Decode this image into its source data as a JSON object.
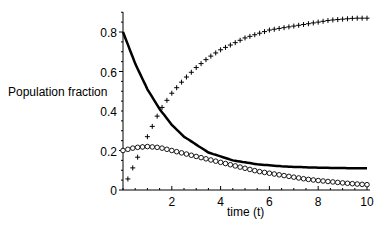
{
  "chart_data": {
    "type": "line",
    "title": "",
    "xlabel": "time (t)",
    "ylabel": "Population fraction",
    "xlim": [
      0,
      10
    ],
    "ylim": [
      0,
      0.9
    ],
    "x_ticks": [
      "2",
      "4",
      "6",
      "8",
      "10"
    ],
    "y_ticks": [
      "0",
      "0.2",
      "0.4",
      "0.6",
      "0.8"
    ],
    "grid": false,
    "legend": null,
    "x": [
      0,
      0.5,
      1,
      1.5,
      2,
      2.5,
      3,
      3.5,
      4,
      4.5,
      5,
      5.5,
      6,
      6.5,
      7,
      7.5,
      8,
      8.5,
      9,
      9.5,
      10
    ],
    "series": [
      {
        "name": "solid line",
        "style": "solid",
        "values": [
          0.8,
          0.64,
          0.51,
          0.41,
          0.33,
          0.27,
          0.23,
          0.19,
          0.17,
          0.15,
          0.14,
          0.13,
          0.125,
          0.12,
          0.117,
          0.115,
          0.113,
          0.112,
          0.111,
          0.11,
          0.11
        ]
      },
      {
        "name": "plus markers",
        "style": "plus",
        "values": [
          0.0,
          0.14,
          0.27,
          0.4,
          0.49,
          0.56,
          0.62,
          0.67,
          0.71,
          0.74,
          0.77,
          0.79,
          0.81,
          0.82,
          0.83,
          0.84,
          0.85,
          0.86,
          0.865,
          0.87,
          0.87
        ]
      },
      {
        "name": "circle markers",
        "style": "circle",
        "values": [
          0.2,
          0.215,
          0.22,
          0.215,
          0.2,
          0.185,
          0.17,
          0.155,
          0.14,
          0.125,
          0.11,
          0.095,
          0.085,
          0.075,
          0.065,
          0.055,
          0.048,
          0.042,
          0.036,
          0.031,
          0.027
        ]
      }
    ]
  }
}
